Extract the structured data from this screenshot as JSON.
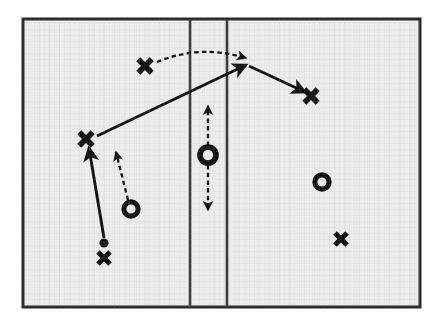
{
  "diagram": {
    "kind": "sports-play-diagram",
    "canvas": {
      "width": 446,
      "height": 329
    },
    "colors": {
      "court_fill": "#ececec",
      "court_border": "#2b2b2b",
      "line": "#3a3a3a",
      "marker": "#111111",
      "page_background": "#ffffff"
    },
    "court": {
      "label": "playing-area",
      "x": 23,
      "y": 19,
      "width": 397,
      "height": 288,
      "border_width": 3
    },
    "court_lines": [
      {
        "name": "vertical-line-left",
        "x1": 190,
        "y1": 19,
        "x2": 190,
        "y2": 307,
        "width": 2.6
      },
      {
        "name": "vertical-line-right",
        "x1": 227,
        "y1": 19,
        "x2": 227,
        "y2": 307,
        "width": 2.6
      }
    ],
    "players": [
      {
        "id": "x-top-left",
        "type": "cross",
        "label": "X",
        "x": 145,
        "y": 66,
        "size": 19
      },
      {
        "id": "x-left-wing",
        "type": "cross",
        "label": "X",
        "x": 86,
        "y": 139,
        "size": 19
      },
      {
        "id": "x-bottom-left",
        "type": "cross",
        "label": "X",
        "x": 104,
        "y": 258,
        "size": 17
      },
      {
        "id": "x-right-top",
        "type": "cross",
        "label": "X",
        "x": 311,
        "y": 96,
        "size": 19
      },
      {
        "id": "x-right-bottom",
        "type": "cross",
        "label": "X",
        "x": 341,
        "y": 239,
        "size": 17
      },
      {
        "id": "o-left-low",
        "type": "ring",
        "label": "O",
        "x": 131,
        "y": 209,
        "size": 17
      },
      {
        "id": "o-center",
        "type": "ring",
        "label": "O",
        "x": 208,
        "y": 155,
        "size": 19
      },
      {
        "id": "o-right",
        "type": "ring",
        "label": "O",
        "x": 322,
        "y": 182,
        "size": 17
      }
    ],
    "ball": {
      "id": "ball-marker",
      "label": "ball",
      "x": 104,
      "y": 243,
      "radius": 4.6
    },
    "solid_paths": [
      {
        "id": "pass-bottom-to-wing",
        "kind": "pass-arrow-solid",
        "points": [
          [
            104,
            238
          ],
          [
            89,
            148
          ]
        ],
        "arrowhead": "end"
      },
      {
        "id": "pass-wing-to-top",
        "kind": "pass-arrow-solid",
        "points": [
          [
            97,
            136
          ],
          [
            246,
            65
          ]
        ],
        "arrowhead": "end"
      },
      {
        "id": "pass-top-to-right-x",
        "kind": "pass-arrow-solid",
        "points": [
          [
            249,
            66
          ],
          [
            305,
            92
          ]
        ],
        "arrowhead": "end"
      }
    ],
    "dashed_paths": [
      {
        "id": "cut-curved-top",
        "kind": "movement-arrow-dashed-curved",
        "start": [
          157,
          62
        ],
        "control": [
          200,
          44
        ],
        "end": [
          246,
          58
        ],
        "arrowhead": "end"
      },
      {
        "id": "cut-o-left-up",
        "kind": "movement-arrow-dashed",
        "points": [
          [
            128,
            200
          ],
          [
            116,
            152
          ]
        ],
        "arrowhead": "end"
      },
      {
        "id": "cut-o-center-up",
        "kind": "movement-arrow-dashed",
        "points": [
          [
            208,
            146
          ],
          [
            208,
            106
          ]
        ],
        "arrowhead": "end"
      },
      {
        "id": "cut-o-center-down",
        "kind": "movement-arrow-dashed",
        "points": [
          [
            208,
            165
          ],
          [
            208,
            210
          ]
        ],
        "arrowhead": "end"
      }
    ]
  }
}
